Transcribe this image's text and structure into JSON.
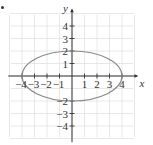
{
  "chart_data": {
    "type": "line",
    "title": "",
    "xlabel": "x",
    "ylabel": "y",
    "xlim": [
      -5,
      5
    ],
    "ylim": [
      -5,
      5
    ],
    "grid": true,
    "x_ticks": [
      -4,
      -3,
      -2,
      -1,
      1,
      2,
      3,
      4
    ],
    "y_ticks": [
      4,
      3,
      2,
      1,
      -2,
      -3,
      -4
    ],
    "x_tick_labels": [
      "−4",
      "−3",
      "−2",
      "−1",
      "1",
      "2",
      "3",
      "4"
    ],
    "y_tick_labels": [
      "4",
      "3",
      "2",
      "1",
      "−2",
      "−3",
      "−4"
    ],
    "series": [
      {
        "name": "ellipse",
        "shape": "ellipse",
        "center": [
          0,
          0
        ],
        "semi_axis_x": 4,
        "semi_axis_y": 2,
        "equation": "x^2/16 + y^2/4 = 1",
        "color": "#8a8a8a"
      }
    ]
  },
  "colors": {
    "grid": "#e2e2e2",
    "axis": "#333333",
    "curve": "#8a8a8a"
  }
}
